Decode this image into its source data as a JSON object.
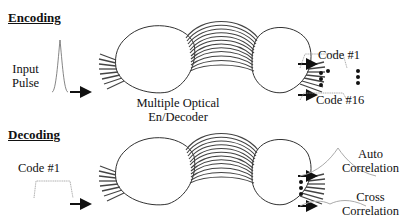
{
  "encoding": {
    "heading": "Encoding",
    "input_label_line1": "Input",
    "input_label_line2": "Pulse",
    "device_label_line1": "Multiple Optical",
    "device_label_line2": "En/Decoder",
    "output_first": "Code #1",
    "output_last": "Code #16"
  },
  "decoding": {
    "heading": "Decoding",
    "input_label": "Code #1",
    "auto_line1": "Auto",
    "auto_line2": "Correlation",
    "cross_line1": "Cross",
    "cross_line2": "Correlation"
  }
}
